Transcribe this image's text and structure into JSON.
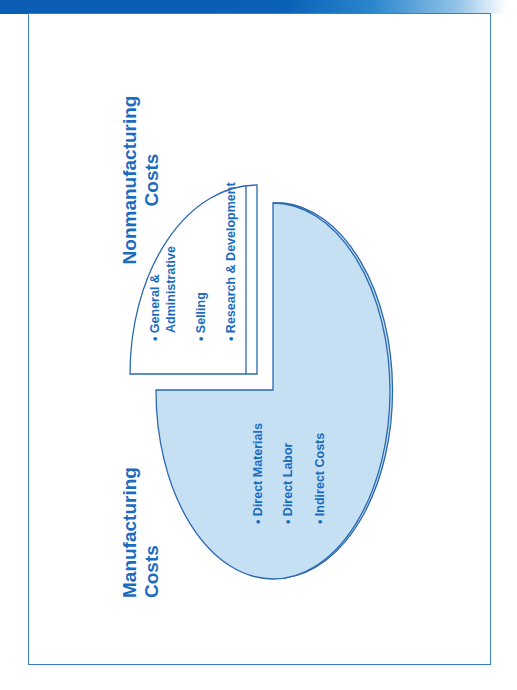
{
  "header": {
    "bar_color": "#0a5db3"
  },
  "diagram": {
    "orientation": "rotated 90 degrees counter-clockwise",
    "colors": {
      "text": "#1a6cc0",
      "stroke": "#2a68b0",
      "manufacturing_fill": "#c5e0f3",
      "nonmanufacturing_fill": "#ffffff"
    },
    "manufacturing": {
      "title_line1": "Manufacturing",
      "title_line2": "Costs",
      "items": [
        "• Direct Materials",
        "• Direct Labor",
        "• Indirect Costs"
      ]
    },
    "nonmanufacturing": {
      "title_line1": "Nonmanufacturing",
      "title_line2": "Costs",
      "items": [
        "• General &",
        "Administrative",
        "• Selling",
        "• Research & Development"
      ]
    }
  }
}
